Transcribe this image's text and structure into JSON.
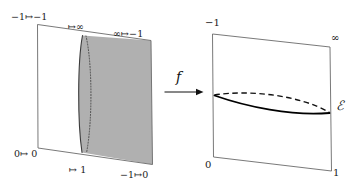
{
  "figure": {
    "background_color": "#ffffff",
    "stroke_color": "#555555",
    "curve_color": "#000000",
    "shade_color": "#b0b0b0"
  },
  "left_panel": {
    "name": "source-quadrilateral",
    "labels": {
      "top_left": "−1↦−1",
      "top_mid": "↦∞",
      "top_right": "∞↦−1",
      "bottom_left": "0↦ 0",
      "bottom_mid": "↦ 1",
      "bottom_right": "−1↦0"
    }
  },
  "map_arrow": {
    "name": "map-arrow",
    "label": "f"
  },
  "right_panel": {
    "name": "target-quadrilateral",
    "labels": {
      "top_left": "−1",
      "top_right": "∞",
      "bottom_left": "0",
      "bottom_right": "1",
      "curve": "ℰ"
    }
  }
}
